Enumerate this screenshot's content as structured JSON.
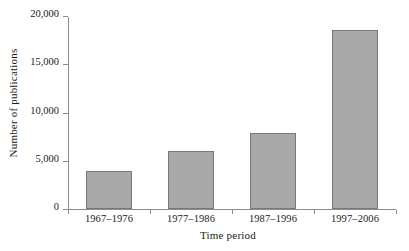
{
  "chart_data": {
    "type": "bar",
    "title": "",
    "xlabel": "Time period",
    "ylabel": "Number of publications",
    "categories": [
      "1967–1976",
      "1977–1986",
      "1987–1996",
      "1997–2006"
    ],
    "values": [
      3900,
      6050,
      7850,
      18500
    ],
    "ylim": [
      0,
      20000
    ],
    "yticks": [
      0,
      5000,
      10000,
      15000,
      20000
    ],
    "ytick_labels": [
      "0",
      "5,000",
      "10,000",
      "15,000",
      "20,000"
    ],
    "grid": false,
    "legend": "none",
    "bar_color": "#a9a9a9",
    "bar_border_color": "#787878",
    "axis_color": "#8c8c8c"
  }
}
